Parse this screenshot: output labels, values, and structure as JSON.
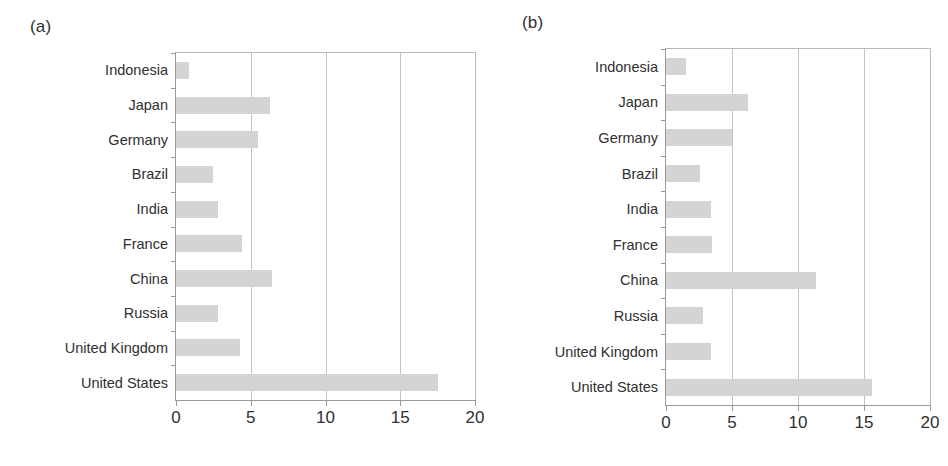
{
  "figure": {
    "panels": [
      {
        "panel_label": "(a)",
        "id": "panel-a",
        "axis_ticks": [
          "0",
          "5",
          "10",
          "15",
          "20"
        ],
        "categories": [
          "Indonesia",
          "Japan",
          "Germany",
          "Brazil",
          "India",
          "France",
          "China",
          "Russia",
          "United Kingdom",
          "United States"
        ],
        "values": [
          0.9,
          6.3,
          5.5,
          2.5,
          2.8,
          4.4,
          6.4,
          2.8,
          4.3,
          17.5
        ]
      },
      {
        "panel_label": "(b)",
        "id": "panel-b",
        "axis_ticks": [
          "0",
          "5",
          "10",
          "15",
          "20"
        ],
        "categories": [
          "Indonesia",
          "Japan",
          "Germany",
          "Brazil",
          "India",
          "France",
          "China",
          "Russia",
          "United Kingdom",
          "United States"
        ],
        "values": [
          1.5,
          6.2,
          5.0,
          2.6,
          3.4,
          3.5,
          11.4,
          2.8,
          3.4,
          15.6
        ]
      }
    ]
  },
  "colors": {
    "bar_fill": "#d4d4d4",
    "gridline": "#c2c2c2",
    "axis": "#9a9a9a",
    "text": "#2f2f2f",
    "background": "#ffffff"
  },
  "chart_data": [
    {
      "type": "bar",
      "orientation": "horizontal",
      "title": "(a)",
      "xlabel": "",
      "ylabel": "",
      "xlim": [
        0,
        20
      ],
      "xticks": [
        0,
        5,
        10,
        15,
        20
      ],
      "grid": true,
      "grid_axis": "x",
      "legend": null,
      "categories": [
        "Indonesia",
        "Japan",
        "Germany",
        "Brazil",
        "India",
        "France",
        "China",
        "Russia",
        "United Kingdom",
        "United States"
      ],
      "values": [
        0.9,
        6.3,
        5.5,
        2.5,
        2.8,
        4.4,
        6.4,
        2.8,
        4.3,
        17.5
      ]
    },
    {
      "type": "bar",
      "orientation": "horizontal",
      "title": "(b)",
      "xlabel": "",
      "ylabel": "",
      "xlim": [
        0,
        20
      ],
      "xticks": [
        0,
        5,
        10,
        15,
        20
      ],
      "grid": true,
      "grid_axis": "x",
      "legend": null,
      "categories": [
        "Indonesia",
        "Japan",
        "Germany",
        "Brazil",
        "India",
        "France",
        "China",
        "Russia",
        "United Kingdom",
        "United States"
      ],
      "values": [
        1.5,
        6.2,
        5.0,
        2.6,
        3.4,
        3.5,
        11.4,
        2.8,
        3.4,
        15.6
      ]
    }
  ]
}
